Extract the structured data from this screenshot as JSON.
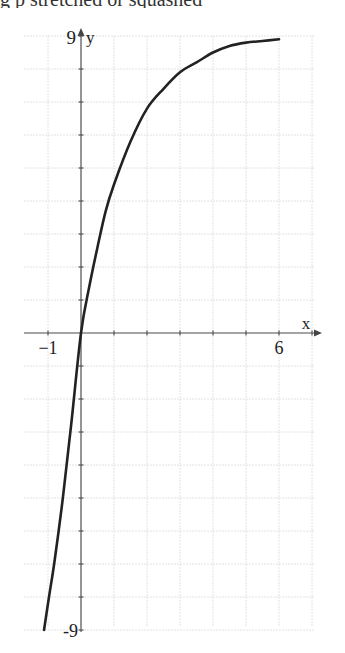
{
  "header": {
    "cropped_text": "g p          stretched or squashed _"
  },
  "chart_data": {
    "type": "line",
    "title": "",
    "xlabel": "x",
    "ylabel": "y",
    "xlim": [
      -1.7,
      7.0
    ],
    "ylim": [
      -9,
      9
    ],
    "x_tick_labels": [
      {
        "value": -1,
        "label": "−1"
      },
      {
        "value": 6,
        "label": "6"
      }
    ],
    "y_tick_labels": [
      {
        "value": 9,
        "label": "9"
      },
      {
        "value": -9,
        "label": "-9"
      }
    ],
    "x_ticks": [
      -1,
      1,
      2,
      3,
      4,
      5,
      6,
      7
    ],
    "y_ticks": [
      -9,
      -8,
      -7,
      -6,
      -5,
      -4,
      -3,
      -2,
      -1,
      1,
      2,
      3,
      4,
      5,
      6,
      7,
      8,
      9
    ],
    "grid": true,
    "grid_step": 1,
    "series": [
      {
        "name": "f(x)",
        "color": "#222222",
        "x": [
          -1.12,
          -0.97,
          -0.8,
          -0.55,
          -0.3,
          0,
          0.25,
          0.5,
          0.75,
          1,
          1.5,
          2,
          2.5,
          3,
          3.5,
          4,
          4.5,
          5,
          5.5,
          6
        ],
        "y": [
          -9,
          -8,
          -6.9,
          -5,
          -2.8,
          0,
          1.4,
          2.6,
          3.7,
          4.5,
          5.8,
          6.8,
          7.4,
          7.9,
          8.2,
          8.5,
          8.7,
          8.8,
          8.85,
          8.9
        ]
      }
    ]
  },
  "layout": {
    "origin_px": [
      81,
      333
    ],
    "px_per_unit_x": 33,
    "px_per_unit_y": 33,
    "grid_px": {
      "left": 24,
      "right": 315,
      "top": 36,
      "bottom": 627
    },
    "x_axis_px": {
      "left": 24,
      "right": 322
    },
    "y_axis_px": {
      "top": 28,
      "bottom": 632
    }
  }
}
